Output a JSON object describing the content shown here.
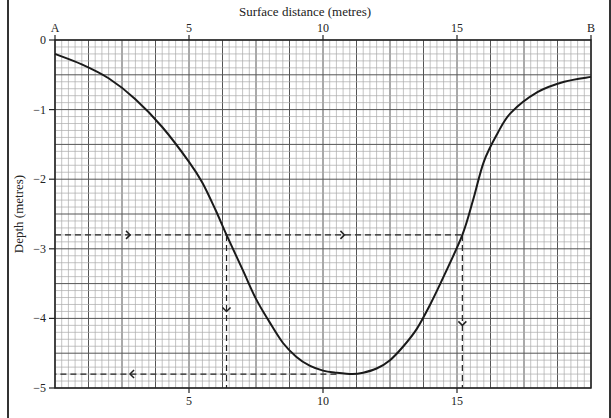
{
  "chart_data": {
    "type": "line",
    "title": "Surface distance (metres)",
    "xlabel": "Surface distance (metres)",
    "ylabel": "Depth (metres)",
    "xlim": [
      0,
      20
    ],
    "ylim": [
      -5,
      0
    ],
    "x_axis_position": "top",
    "x_top_ticks": [
      {
        "value": 0,
        "label": "A"
      },
      {
        "value": 5,
        "label": "5"
      },
      {
        "value": 10,
        "label": "10"
      },
      {
        "value": 15,
        "label": "15"
      },
      {
        "value": 20,
        "label": "B"
      }
    ],
    "x_bottom_ticks": [
      {
        "value": 5,
        "label": "5"
      },
      {
        "value": 10,
        "label": "10"
      },
      {
        "value": 15,
        "label": "15"
      }
    ],
    "y_ticks": [
      {
        "value": 0,
        "label": "0"
      },
      {
        "value": -1,
        "label": "-1"
      },
      {
        "value": -2,
        "label": "-2"
      },
      {
        "value": -3,
        "label": "-3"
      },
      {
        "value": -4,
        "label": "-4"
      },
      {
        "value": -5,
        "label": "-5"
      }
    ],
    "grid": true,
    "grid_spacing": {
      "x_minor": 0.25,
      "x_major": 1.25,
      "y_minor": 0.1,
      "y_major": 0.5
    },
    "series": [
      {
        "name": "Cross-section profile A-B",
        "style": "solid",
        "points": [
          [
            0,
            -0.2
          ],
          [
            1,
            -0.35
          ],
          [
            2,
            -0.55
          ],
          [
            3,
            -0.85
          ],
          [
            4,
            -1.25
          ],
          [
            5,
            -1.75
          ],
          [
            5.5,
            -2.05
          ],
          [
            6,
            -2.45
          ],
          [
            6.4,
            -2.8
          ],
          [
            7,
            -3.3
          ],
          [
            7.5,
            -3.72
          ],
          [
            8,
            -4.05
          ],
          [
            8.5,
            -4.35
          ],
          [
            9,
            -4.55
          ],
          [
            9.5,
            -4.68
          ],
          [
            10,
            -4.75
          ],
          [
            10.5,
            -4.78
          ],
          [
            11.1,
            -4.8
          ],
          [
            11.5,
            -4.78
          ],
          [
            12,
            -4.72
          ],
          [
            12.5,
            -4.6
          ],
          [
            13,
            -4.4
          ],
          [
            13.5,
            -4.15
          ],
          [
            14,
            -3.8
          ],
          [
            14.5,
            -3.4
          ],
          [
            15.2,
            -2.8
          ],
          [
            15.6,
            -2.3
          ],
          [
            16,
            -1.75
          ],
          [
            16.5,
            -1.35
          ],
          [
            17,
            -1.05
          ],
          [
            18,
            -0.75
          ],
          [
            19,
            -0.6
          ],
          [
            20,
            -0.53
          ]
        ]
      }
    ],
    "annotations": [
      {
        "type": "dashed-line",
        "from": [
          0,
          -2.8
        ],
        "to": [
          15.2,
          -2.8
        ],
        "arrows": [
          "right",
          "right"
        ],
        "arrow_x": [
          2.8,
          10.8
        ]
      },
      {
        "type": "dashed-line",
        "from": [
          6.4,
          -2.8
        ],
        "to": [
          6.4,
          -5
        ],
        "arrows": [
          "down"
        ],
        "arrow_y": -3.9
      },
      {
        "type": "dashed-line",
        "from": [
          15.2,
          -2.8
        ],
        "to": [
          15.2,
          -5
        ],
        "arrows": [
          "down"
        ],
        "arrow_y": -4.1
      },
      {
        "type": "dashed-line",
        "from": [
          10.5,
          -4.8
        ],
        "to": [
          0,
          -4.8
        ],
        "arrows": [
          "left"
        ],
        "arrow_x": 2.8
      }
    ]
  }
}
